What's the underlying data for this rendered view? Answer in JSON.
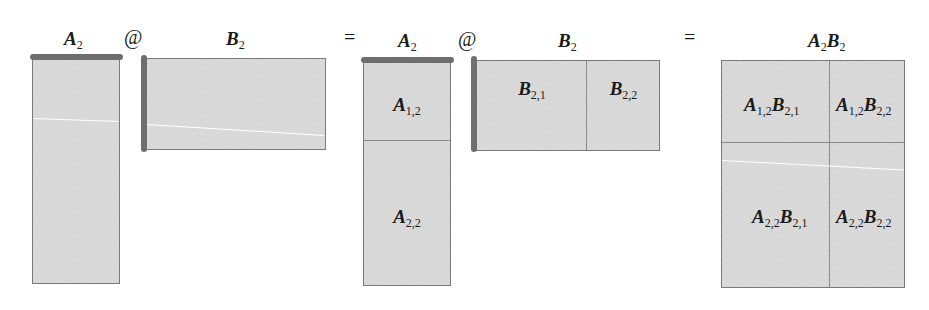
{
  "equation": {
    "operator_matmul": "@",
    "operator_equals": "="
  },
  "lhs": {
    "a": {
      "base": "A",
      "sub": "2"
    },
    "b": {
      "base": "B",
      "sub": "2"
    }
  },
  "partitioned": {
    "a": {
      "base": "A",
      "sub": "2",
      "blocks": [
        {
          "base": "A",
          "sub": "1,2"
        },
        {
          "base": "A",
          "sub": "2,2"
        }
      ]
    },
    "b": {
      "base": "B",
      "sub": "2",
      "blocks": [
        {
          "base": "B",
          "sub": "2,1"
        },
        {
          "base": "B",
          "sub": "2,2"
        }
      ]
    }
  },
  "result": {
    "title": {
      "a_base": "A",
      "a_sub": "2",
      "b_base": "B",
      "b_sub": "2"
    },
    "cells": [
      {
        "a_base": "A",
        "a_sub": "1,2",
        "b_base": "B",
        "b_sub": "2,1"
      },
      {
        "a_base": "A",
        "a_sub": "1,2",
        "b_base": "B",
        "b_sub": "2,2"
      },
      {
        "a_base": "A",
        "a_sub": "2,2",
        "b_base": "B",
        "b_sub": "2,1"
      },
      {
        "a_base": "A",
        "a_sub": "2,2",
        "b_base": "B",
        "b_sub": "2,2"
      }
    ]
  },
  "colors": {
    "block_fill": "#d6d6d6",
    "block_border": "#7a7a7a",
    "highlight_bar": "#6e6e6e",
    "text": "#1a1a1a"
  }
}
